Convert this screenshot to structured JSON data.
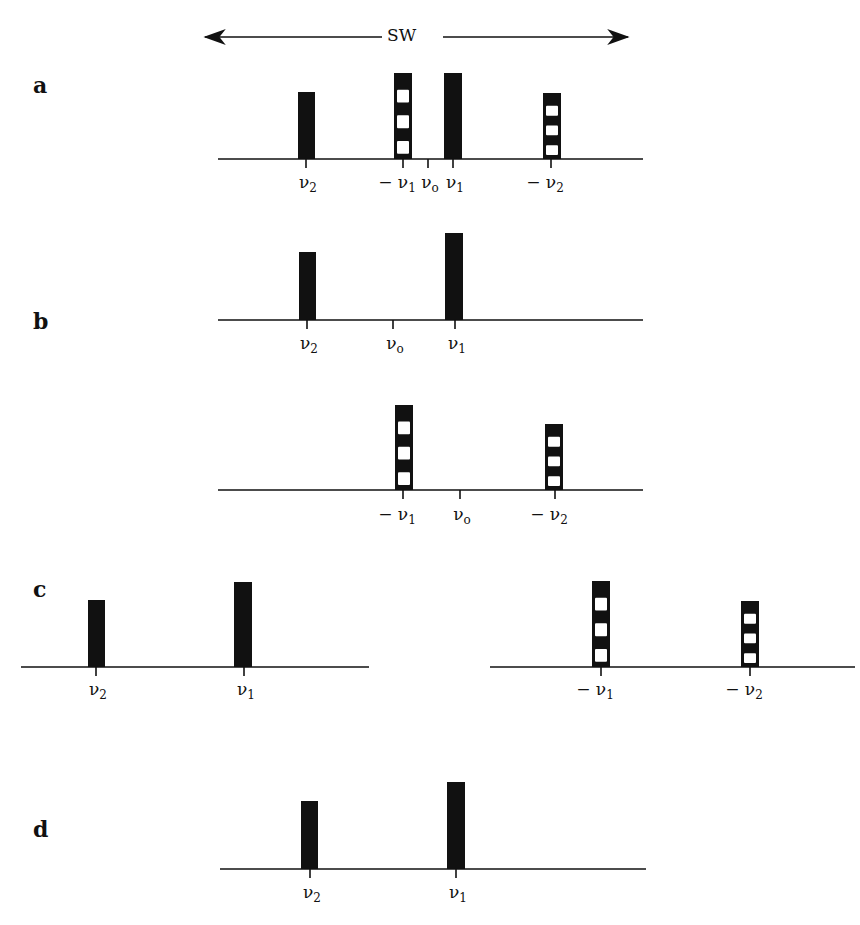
{
  "header": {
    "sw_label": "SW",
    "sw_arrow": {
      "x_start": 205,
      "x_end": 628,
      "y": 37
    }
  },
  "colors": {
    "peak_fill": "#111111",
    "stripe_gap": "#ffffff",
    "axis": "#111111",
    "background": "#ffffff"
  },
  "legend": {
    "solid_peak": "real (positive frequency) peak",
    "striped_peak": "mirror image (negative frequency) peak"
  },
  "panels": [
    {
      "id": "a",
      "letter": "a",
      "letter_pos": [
        33,
        72
      ],
      "baseline": {
        "x1": 218,
        "x2": 643,
        "y": 159
      },
      "peaks": [
        {
          "label": "ν2",
          "x": 298,
          "w": 17,
          "top": 92,
          "style": "solid"
        },
        {
          "label": "−ν1",
          "x": 394,
          "w": 18,
          "top": 73,
          "style": "striped"
        },
        {
          "label": "ν1",
          "x": 444,
          "w": 18,
          "top": 73,
          "style": "solid"
        },
        {
          "label": "−ν2",
          "x": 543,
          "w": 18,
          "top": 93,
          "style": "striped"
        }
      ],
      "ticks": [
        {
          "x": 306,
          "label_base": "ν",
          "label_sub": "2",
          "prefix": ""
        },
        {
          "x": 403,
          "label_base": "ν",
          "label_sub": "1",
          "prefix": "− "
        },
        {
          "x": 428,
          "label_base": "ν",
          "label_sub": "o",
          "prefix": ""
        },
        {
          "x": 453,
          "label_base": "ν",
          "label_sub": "1",
          "prefix": ""
        },
        {
          "x": 551,
          "label_base": "ν",
          "label_sub": "2",
          "prefix": "− "
        }
      ],
      "label_y": 172
    },
    {
      "id": "b-top",
      "letter": "b",
      "letter_pos": [
        33,
        308
      ],
      "baseline": {
        "x1": 218,
        "x2": 643,
        "y": 320
      },
      "peaks": [
        {
          "label": "ν2",
          "x": 299,
          "w": 17,
          "top": 252,
          "style": "solid"
        },
        {
          "label": "ν1",
          "x": 445,
          "w": 18,
          "top": 233,
          "style": "solid"
        }
      ],
      "ticks": [
        {
          "x": 307,
          "label_base": "ν",
          "label_sub": "2",
          "prefix": ""
        },
        {
          "x": 393,
          "label_base": "ν",
          "label_sub": "o",
          "prefix": ""
        },
        {
          "x": 455,
          "label_base": "ν",
          "label_sub": "1",
          "prefix": ""
        }
      ],
      "label_y": 333
    },
    {
      "id": "b-bottom",
      "letter": "",
      "baseline": {
        "x1": 218,
        "x2": 643,
        "y": 490
      },
      "peaks": [
        {
          "label": "−ν1",
          "x": 395,
          "w": 18,
          "top": 405,
          "style": "striped"
        },
        {
          "label": "−ν2",
          "x": 545,
          "w": 18,
          "top": 424,
          "style": "striped"
        }
      ],
      "ticks": [
        {
          "x": 403,
          "label_base": "ν",
          "label_sub": "1",
          "prefix": "− "
        },
        {
          "x": 460,
          "label_base": "ν",
          "label_sub": "o",
          "prefix": ""
        },
        {
          "x": 555,
          "label_base": "ν",
          "label_sub": "2",
          "prefix": "− "
        }
      ],
      "label_y": 504
    },
    {
      "id": "c-left",
      "letter": "c",
      "letter_pos": [
        33,
        576
      ],
      "baseline": {
        "x1": 21,
        "x2": 369,
        "y": 667
      },
      "peaks": [
        {
          "label": "ν2",
          "x": 88,
          "w": 17,
          "top": 600,
          "style": "solid"
        },
        {
          "label": "ν1",
          "x": 234,
          "w": 18,
          "top": 582,
          "style": "solid"
        }
      ],
      "ticks": [
        {
          "x": 96,
          "label_base": "ν",
          "label_sub": "2",
          "prefix": ""
        },
        {
          "x": 244,
          "label_base": "ν",
          "label_sub": "1",
          "prefix": ""
        }
      ],
      "label_y": 679
    },
    {
      "id": "c-right",
      "letter": "",
      "baseline": {
        "x1": 490,
        "x2": 855,
        "y": 667
      },
      "peaks": [
        {
          "label": "−ν1",
          "x": 592,
          "w": 18,
          "top": 581,
          "style": "striped"
        },
        {
          "label": "−ν2",
          "x": 741,
          "w": 18,
          "top": 601,
          "style": "striped"
        }
      ],
      "ticks": [
        {
          "x": 601,
          "label_base": "ν",
          "label_sub": "1",
          "prefix": "− "
        },
        {
          "x": 750,
          "label_base": "ν",
          "label_sub": "2",
          "prefix": "− "
        }
      ],
      "label_y": 679
    },
    {
      "id": "d",
      "letter": "d",
      "letter_pos": [
        33,
        816
      ],
      "baseline": {
        "x1": 220,
        "x2": 646,
        "y": 869
      },
      "peaks": [
        {
          "label": "ν2",
          "x": 301,
          "w": 17,
          "top": 801,
          "style": "solid"
        },
        {
          "label": "ν1",
          "x": 447,
          "w": 18,
          "top": 782,
          "style": "solid"
        }
      ],
      "ticks": [
        {
          "x": 310,
          "label_base": "ν",
          "label_sub": "2",
          "prefix": ""
        },
        {
          "x": 456,
          "label_base": "ν",
          "label_sub": "1",
          "prefix": ""
        }
      ],
      "label_y": 882
    }
  ]
}
